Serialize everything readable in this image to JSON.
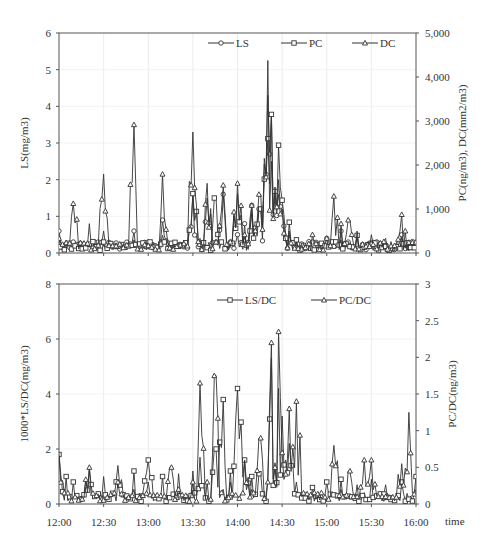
{
  "chart_data": [
    {
      "type": "line",
      "title": "",
      "xlabel": "time",
      "ylabel": "LS(mg/m3)",
      "y2label": "PC(ng/m3), DC(mm2/m3)",
      "ylim": [
        0,
        6
      ],
      "y2lim": [
        0,
        5000
      ],
      "yticks": [
        "0",
        "1",
        "2",
        "3",
        "4",
        "5",
        "6"
      ],
      "y2ticks": [
        "0",
        "1,000",
        "2,000",
        "3,000",
        "4,000",
        "5,000"
      ],
      "xticks": [
        "12:00",
        "12:30",
        "13:00",
        "13:30",
        "14:00",
        "14:30",
        "15:00",
        "15:30",
        "16:00"
      ],
      "grid": true,
      "legend_position": "top-right inside",
      "series": [
        {
          "name": "LS",
          "axis": "left",
          "marker": "circle",
          "x": [
            "12:00",
            "12:10",
            "12:20",
            "12:26",
            "12:30",
            "12:40",
            "12:50",
            "13:00",
            "13:10",
            "13:20",
            "13:30",
            "13:35",
            "13:40",
            "13:45",
            "13:50",
            "13:55",
            "14:00",
            "14:05",
            "14:10",
            "14:15",
            "14:20",
            "14:23",
            "14:25",
            "14:28",
            "14:30",
            "14:35",
            "14:40",
            "14:50",
            "15:00",
            "15:10",
            "15:15",
            "15:20",
            "15:30",
            "15:40",
            "15:50",
            "16:00"
          ],
          "values": [
            0.6,
            0.3,
            0.8,
            0.3,
            0.6,
            0.2,
            0.6,
            0.3,
            0.9,
            0.3,
            1.6,
            0.4,
            1.5,
            0.3,
            1.6,
            0.3,
            0.5,
            0.8,
            1.3,
            1.2,
            4.3,
            3.8,
            1.5,
            2.0,
            1.2,
            0.5,
            0.3,
            0.3,
            0.4,
            0.6,
            0.3,
            0.5,
            0.3,
            0.3,
            0.5,
            0.2
          ]
        },
        {
          "name": "PC",
          "axis": "right",
          "marker": "square",
          "x": [
            "12:00",
            "12:10",
            "12:20",
            "12:30",
            "12:40",
            "12:50",
            "13:00",
            "13:10",
            "13:20",
            "13:30",
            "13:35",
            "13:45",
            "13:55",
            "14:00",
            "14:05",
            "14:10",
            "14:15",
            "14:20",
            "14:23",
            "14:25",
            "14:28",
            "14:30",
            "14:35",
            "14:40",
            "14:50",
            "15:00",
            "15:10",
            "15:20",
            "15:30",
            "15:40",
            "15:50",
            "16:00"
          ],
          "values": [
            300,
            150,
            200,
            250,
            150,
            300,
            200,
            400,
            150,
            1350,
            200,
            1250,
            200,
            1350,
            400,
            900,
            1000,
            2600,
            3150,
            1400,
            2450,
            1200,
            700,
            300,
            150,
            200,
            300,
            400,
            200,
            150,
            350,
            100
          ]
        },
        {
          "name": "DC",
          "axis": "left",
          "marker": "triangle",
          "x": [
            "12:00",
            "12:10",
            "12:20",
            "12:30",
            "12:40",
            "12:50",
            "13:00",
            "13:10",
            "13:20",
            "13:30",
            "13:35",
            "13:40",
            "13:45",
            "13:50",
            "13:55",
            "14:00",
            "14:05",
            "14:10",
            "14:15",
            "14:20",
            "14:23",
            "14:25",
            "14:28",
            "14:30",
            "14:35",
            "14:40",
            "14:50",
            "15:00",
            "15:05",
            "15:10",
            "15:15",
            "15:20",
            "15:30",
            "15:40",
            "15:50",
            "15:53",
            "16:00"
          ],
          "values": [
            0.4,
            1.35,
            0.2,
            2.15,
            0.2,
            3.5,
            0.2,
            2.15,
            0.2,
            3.3,
            0.3,
            1.9,
            0.3,
            1.85,
            0.3,
            1.9,
            0.5,
            1.3,
            1.6,
            5.25,
            2.5,
            1.8,
            1.6,
            1.2,
            0.6,
            0.3,
            0.5,
            0.4,
            1.55,
            0.8,
            0.9,
            0.6,
            0.5,
            0.4,
            1.05,
            0.6,
            0.3
          ]
        }
      ]
    },
    {
      "type": "line",
      "title": "",
      "xlabel": "time",
      "ylabel": "1000*LS/DC(mg/m3)",
      "y2label": "PC/DC(ng/m3)",
      "ylim": [
        0,
        8
      ],
      "y2lim": [
        0,
        3
      ],
      "yticks": [
        "0",
        "2",
        "4",
        "6",
        "8"
      ],
      "y2ticks": [
        "0",
        "0.5",
        "1",
        "1.5",
        "2",
        "2.5",
        "3"
      ],
      "xticks": [
        "12:00",
        "12:30",
        "13:00",
        "13:30",
        "14:00",
        "14:30",
        "15:00",
        "15:30",
        "16:00"
      ],
      "grid": true,
      "legend_position": "top-right inside",
      "series": [
        {
          "name": "LS/DC",
          "axis": "left",
          "marker": "square",
          "x": [
            "12:00",
            "12:05",
            "12:10",
            "12:20",
            "12:30",
            "12:40",
            "12:50",
            "13:00",
            "13:10",
            "13:20",
            "13:30",
            "13:35",
            "13:45",
            "13:50",
            "13:55",
            "14:00",
            "14:05",
            "14:10",
            "14:15",
            "14:20",
            "14:23",
            "14:25",
            "14:28",
            "14:30",
            "14:35",
            "14:40",
            "14:50",
            "15:00",
            "15:10",
            "15:20",
            "15:30",
            "15:40",
            "15:50",
            "16:00"
          ],
          "values": [
            1.8,
            1.0,
            0.8,
            1.3,
            1.0,
            1.4,
            1.2,
            1.6,
            1.0,
            1.1,
            1.2,
            1.7,
            2.0,
            3.8,
            1.2,
            4.2,
            1.6,
            1.0,
            1.1,
            1.0,
            5.3,
            1.5,
            4.2,
            3.2,
            2.2,
            0.8,
            0.6,
            0.8,
            0.9,
            0.7,
            0.9,
            0.7,
            0.8,
            1.0
          ]
        },
        {
          "name": "PC/DC",
          "axis": "right",
          "marker": "triangle",
          "x": [
            "12:00",
            "12:10",
            "12:20",
            "12:30",
            "12:40",
            "12:50",
            "13:00",
            "13:10",
            "13:15",
            "13:20",
            "13:30",
            "13:35",
            "13:40",
            "13:45",
            "13:50",
            "13:55",
            "14:00",
            "14:05",
            "14:10",
            "14:15",
            "14:20",
            "14:23",
            "14:25",
            "14:28",
            "14:30",
            "14:35",
            "14:40",
            "14:50",
            "15:00",
            "15:05",
            "15:10",
            "15:15",
            "15:20",
            "15:25",
            "15:30",
            "15:40",
            "15:50",
            "15:55",
            "16:00"
          ],
          "values": [
            0.7,
            0.1,
            0.5,
            0.05,
            0.3,
            0.2,
            0.3,
            0.1,
            0.5,
            0.2,
            0.3,
            1.65,
            0.3,
            1.75,
            0.2,
            0.3,
            0.1,
            0.6,
            0.2,
            0.9,
            0.3,
            2.2,
            0.5,
            2.35,
            0.7,
            1.3,
            1.4,
            0.1,
            0.05,
            0.8,
            0.2,
            0.45,
            0.1,
            0.6,
            0.6,
            0.1,
            0.55,
            1.25,
            0.2
          ]
        }
      ]
    }
  ]
}
